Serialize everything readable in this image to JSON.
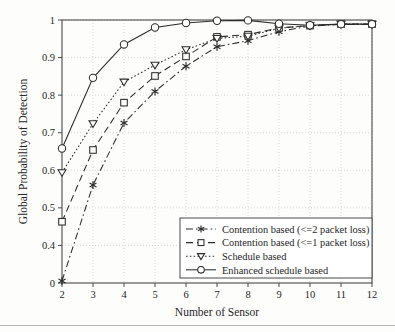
{
  "chart_data": {
    "type": "line",
    "title": "",
    "xlabel": "Number of Sensor",
    "ylabel": "Global Probability of Detection",
    "x": [
      2,
      3,
      4,
      5,
      6,
      7,
      8,
      9,
      10,
      11,
      12
    ],
    "xlim": [
      2,
      12
    ],
    "ylim": [
      0,
      1
    ],
    "xticks": [
      "2",
      "3",
      "4",
      "5",
      "6",
      "7",
      "8",
      "9",
      "10",
      "11",
      "12"
    ],
    "yticks": [
      "0",
      "0.4",
      "0.5",
      "0.6",
      "0.7",
      "0.8",
      "0.9",
      "1"
    ],
    "ytick_values": [
      0,
      0.4,
      0.5,
      0.6,
      0.7,
      0.8,
      0.9,
      1
    ],
    "grid": true,
    "grid_style": "dotted",
    "legend_position": "lower right",
    "series": [
      {
        "name": "Contention based (<=2 packet loss)",
        "marker": "asterisk",
        "dash": "dash-dot",
        "values": [
          0.022,
          0.561,
          0.726,
          0.81,
          0.877,
          0.929,
          0.945,
          0.969,
          0.984,
          0.988,
          0.988
        ]
      },
      {
        "name": "Contention based (<=1 packet loss)",
        "marker": "square",
        "dash": "dashed",
        "values": [
          0.463,
          0.654,
          0.78,
          0.851,
          0.903,
          0.955,
          0.961,
          0.979,
          0.985,
          0.989,
          0.989
        ]
      },
      {
        "name": "Schedule based",
        "marker": "triangle-down",
        "dash": "dotted",
        "values": [
          0.594,
          0.724,
          0.835,
          0.88,
          0.921,
          0.951,
          0.957,
          0.978,
          0.985,
          0.989,
          0.989
        ]
      },
      {
        "name": "Enhanced schedule based",
        "marker": "circle",
        "dash": "solid",
        "values": [
          0.658,
          0.846,
          0.935,
          0.98,
          0.992,
          0.998,
          0.999,
          0.99,
          0.986,
          0.989,
          0.989
        ]
      }
    ]
  },
  "legend": {
    "items": [
      "Contention based (<=2 packet loss)",
      "Contention based (<=1 packet loss)",
      "Schedule based",
      "Enhanced schedule based"
    ]
  },
  "colors": {
    "line": "#2b2b2b",
    "grid": "#c9c9c9",
    "axis": "#4a4a4a",
    "background": "#fdfdfc",
    "text": "#262626"
  }
}
